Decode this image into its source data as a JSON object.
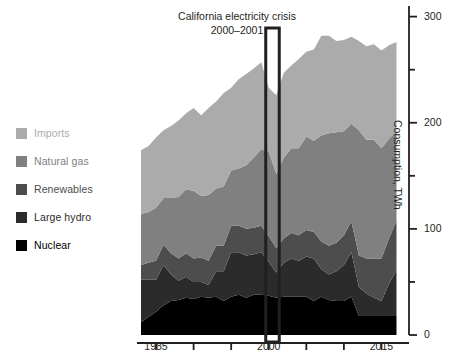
{
  "chart_data": {
    "type": "area",
    "stacked": true,
    "title": "California electricity crisis",
    "subtitle": "2000–2001",
    "xlabel": "",
    "ylabel": "Consumption, TWh",
    "xlim": [
      1983,
      2018
    ],
    "ylim": [
      0,
      310
    ],
    "yticks_major": [
      0,
      100,
      200,
      300
    ],
    "yticks_minor": [
      50,
      150,
      250
    ],
    "xticks_major": [
      1985,
      2000,
      2015
    ],
    "xticks_minor": [
      1990,
      1995,
      2005,
      2010
    ],
    "grid": false,
    "legend_position": "left-outside",
    "x": [
      1983,
      1984,
      1985,
      1986,
      1987,
      1988,
      1989,
      1990,
      1991,
      1992,
      1993,
      1994,
      1995,
      1996,
      1997,
      1998,
      1999,
      2000,
      2001,
      2002,
      2003,
      2004,
      2005,
      2006,
      2007,
      2008,
      2009,
      2010,
      2011,
      2012,
      2013,
      2014,
      2015,
      2016,
      2017
    ],
    "series": [
      {
        "name": "Nuclear",
        "color": "#000000",
        "values": [
          12,
          17,
          22,
          28,
          32,
          33,
          35,
          34,
          36,
          35,
          36,
          32,
          36,
          38,
          35,
          38,
          38,
          37,
          35,
          36,
          36,
          36,
          36,
          32,
          36,
          33,
          32,
          32,
          36,
          18,
          18,
          18,
          18,
          18,
          18
        ]
      },
      {
        "name": "Large hydro",
        "color": "#2b2b2b",
        "values": [
          40,
          35,
          30,
          38,
          25,
          18,
          20,
          16,
          14,
          12,
          24,
          28,
          42,
          40,
          40,
          38,
          40,
          32,
          24,
          32,
          36,
          34,
          38,
          40,
          26,
          24,
          28,
          34,
          42,
          27,
          21,
          17,
          14,
          30,
          43
        ]
      },
      {
        "name": "Renewables",
        "color": "#4d4d4d",
        "values": [
          14,
          16,
          18,
          19,
          20,
          21,
          22,
          22,
          23,
          23,
          24,
          24,
          25,
          25,
          25,
          25,
          25,
          24,
          23,
          23,
          24,
          24,
          25,
          25,
          26,
          27,
          27,
          28,
          29,
          30,
          33,
          37,
          40,
          43,
          47
        ]
      },
      {
        "name": "Natural gas",
        "color": "#808080",
        "values": [
          48,
          48,
          50,
          44,
          52,
          58,
          60,
          64,
          58,
          62,
          54,
          56,
          52,
          54,
          60,
          66,
          72,
          80,
          70,
          76,
          80,
          82,
          88,
          86,
          100,
          106,
          104,
          98,
          92,
          118,
          112,
          112,
          104,
          94,
          84
        ]
      },
      {
        "name": "Imports",
        "color": "#ababab",
        "values": [
          60,
          62,
          66,
          64,
          68,
          72,
          72,
          78,
          76,
          82,
          82,
          88,
          78,
          84,
          86,
          84,
          82,
          60,
          74,
          80,
          78,
          84,
          80,
          86,
          94,
          92,
          86,
          86,
          82,
          84,
          88,
          90,
          92,
          88,
          84
        ]
      }
    ],
    "highlight": {
      "label": "California electricity crisis",
      "from_year": 2000,
      "to_year": 2001,
      "stroke": "#231f20"
    }
  },
  "legend": {
    "items": [
      {
        "label": "Imports",
        "color": "#ababab",
        "text_color": "#ababab"
      },
      {
        "label": "Natural gas",
        "color": "#808080",
        "text_color": "#808080"
      },
      {
        "label": "Renewables",
        "color": "#4d4d4d",
        "text_color": "#4d4d4d"
      },
      {
        "label": "Large hydro",
        "color": "#2b2b2b",
        "text_color": "#2b2b2b"
      },
      {
        "label": "Nuclear",
        "color": "#000000",
        "text_color": "#000000"
      }
    ]
  },
  "axes": {
    "y_title": "Consumption, TWh",
    "y_labels": [
      "300",
      "200",
      "100",
      "0"
    ],
    "x_labels": [
      "1985",
      "2000",
      "2015"
    ]
  },
  "title": {
    "line1": "California electricity crisis",
    "line2": "2000–2001"
  }
}
